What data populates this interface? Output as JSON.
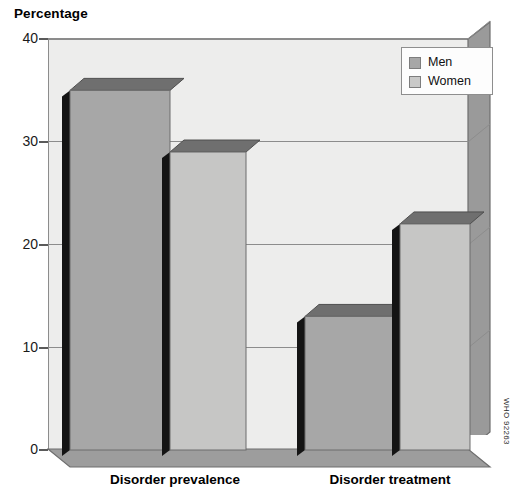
{
  "chart_data": {
    "type": "bar",
    "title": "",
    "subtitle": "",
    "ylabel": "Percentage",
    "xlabel": "",
    "categories": [
      "Disorder prevalence",
      "Disorder treatment"
    ],
    "series": [
      {
        "name": "Men",
        "color": "#a7a7a7",
        "values": [
          35,
          13
        ]
      },
      {
        "name": "Women",
        "color": "#c6c6c5",
        "values": [
          29,
          22
        ]
      }
    ],
    "ylim": [
      0,
      40
    ],
    "yticks": [
      0,
      10,
      20,
      30,
      40
    ],
    "ytick_labels": [
      "0",
      "10",
      "20",
      "30",
      "40"
    ],
    "grid": true,
    "legend_position": "top-right",
    "style": "3d-bar",
    "annotations": [
      "WHO 92263"
    ]
  },
  "axis": {
    "y_title": "Percentage",
    "tick_labels": [
      "40",
      "30",
      "20",
      "10",
      "0"
    ]
  },
  "legend": {
    "items": [
      {
        "label": "Men",
        "swatch": "men-swatch"
      },
      {
        "label": "Women",
        "swatch": "women-swatch"
      }
    ]
  },
  "categories": [
    {
      "label": "Disorder prevalence"
    },
    {
      "label": "Disorder treatment"
    }
  ],
  "credit": {
    "text": "WHO 92263"
  },
  "colors": {
    "men_bar": "#a7a7a7",
    "women_bar": "#c6c6c5",
    "plot_background": "#ededec",
    "wall": "#9a9a9a",
    "floor": "#9d9d9d",
    "gridline": "#8c8c8c",
    "bar_shadow": "#141414"
  }
}
